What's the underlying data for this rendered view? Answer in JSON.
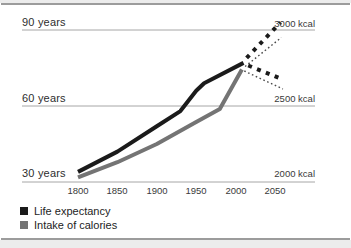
{
  "chart_data": {
    "type": "line",
    "title": "",
    "x_ticks": [
      "1800",
      "1850",
      "1900",
      "1950",
      "2000",
      "2050"
    ],
    "x_range": [
      1800,
      2050
    ],
    "left_axis": {
      "unit": "years",
      "labels": [
        "90 years",
        "60 years",
        "30 years"
      ],
      "values": [
        90,
        60,
        30
      ],
      "range": [
        30,
        90
      ]
    },
    "right_axis": {
      "unit": "kcal",
      "labels": [
        "3000 kcal",
        "2500 kcal",
        "2000 kcal"
      ],
      "values": [
        3000,
        2500,
        2000
      ],
      "range": [
        2000,
        3000
      ]
    },
    "grid": "horizontal-only",
    "series": [
      {
        "name": "Life expectancy",
        "axis": "left",
        "style": "solid",
        "color": "#1b1b1b",
        "points": [
          [
            1800,
            34
          ],
          [
            1850,
            42
          ],
          [
            1900,
            52
          ],
          [
            1930,
            58
          ],
          [
            1950,
            66
          ],
          [
            1960,
            69
          ],
          [
            2010,
            77
          ]
        ]
      },
      {
        "name": "Intake of calories",
        "axis": "right",
        "style": "solid",
        "color": "#747474",
        "points": [
          [
            1800,
            2030
          ],
          [
            1850,
            2130
          ],
          [
            1900,
            2250
          ],
          [
            1950,
            2395
          ],
          [
            1980,
            2480
          ],
          [
            2008,
            2740
          ]
        ]
      }
    ],
    "projections": [
      {
        "series": "Life expectancy",
        "scenario": "high",
        "axis": "left",
        "style": "square-dash",
        "color": "#1b1b1b",
        "points": [
          [
            2014,
            79
          ],
          [
            2057,
            93
          ]
        ]
      },
      {
        "series": "Life expectancy",
        "scenario": "low",
        "axis": "left",
        "style": "square-dash",
        "color": "#1b1b1b",
        "points": [
          [
            2016,
            76
          ],
          [
            2060,
            70.5
          ]
        ]
      },
      {
        "series": "Intake of calories",
        "scenario": "high",
        "axis": "right",
        "style": "dotted",
        "color": "#4a4a4a",
        "points": [
          [
            2012,
            2760
          ],
          [
            2058,
            2950
          ]
        ]
      },
      {
        "series": "Intake of calories",
        "scenario": "low",
        "axis": "right",
        "style": "dotted",
        "color": "#4a4a4a",
        "points": [
          [
            2011,
            2730
          ],
          [
            2060,
            2612
          ]
        ]
      }
    ],
    "legend": [
      {
        "label": "Life expectancy",
        "color": "#1b1b1b"
      },
      {
        "label": "Intake of calories",
        "color": "#747474"
      }
    ],
    "colors": {
      "gridline": "#a6a6a6",
      "frame_rule": "#9c9c9c"
    }
  }
}
